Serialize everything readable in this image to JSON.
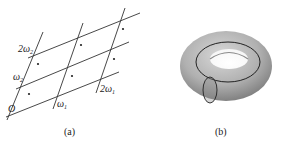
{
  "panels": [
    {
      "caption": "(a)",
      "labels": {
        "origin": "O",
        "omega1": "ω",
        "omega1_sub": "1",
        "two_omega1": "2ω",
        "two_omega1_sub": "1",
        "omega2": "ω",
        "omega2_sub": "2",
        "two_omega2": "2ω",
        "two_omega2_sub": "2"
      },
      "description": "Period lattice generated by ω1 and ω2 with one marked point per parallelogram"
    },
    {
      "caption": "(b)",
      "description": "Torus with longitude and meridian cycles"
    }
  ],
  "colors": {
    "line": "#333333",
    "torus_light": "#c9c9c9",
    "torus_dark": "#7a7a7a"
  }
}
